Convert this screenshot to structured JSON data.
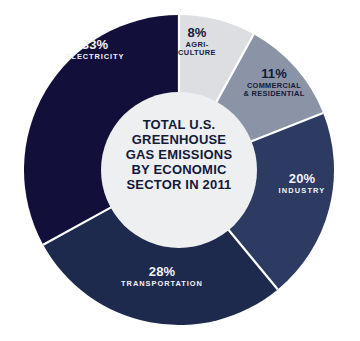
{
  "chart_data": {
    "type": "pie",
    "variant": "donut",
    "title": "TOTAL U.S. GREENHOUSE GAS EMISSIONS BY ECONOMIC SECTOR IN 2011",
    "title_lines": [
      "TOTAL U.S.",
      "GREENHOUSE",
      "GAS EMISSIONS",
      "BY ECONOMIC",
      "SECTOR IN 2011"
    ],
    "unit": "%",
    "legend_position": "none",
    "labels_inside_slices": true,
    "start_angle_deg": 0,
    "direction": "clockwise",
    "categories": [
      "AGRICULTURE",
      "COMMERCIAL & RESIDENTIAL",
      "INDUSTRY",
      "TRANSPORTATION",
      "ELECTRICITY"
    ],
    "values": [
      8,
      11,
      20,
      28,
      33
    ],
    "total": 100,
    "slices": [
      {
        "key": "agriculture",
        "name": "AGRI-\nCULTURE",
        "name_flat": "AGRICULTURE",
        "value": 8,
        "percent_label": "8%",
        "color": "#dcdee2",
        "text_tone": "dark"
      },
      {
        "key": "commercial",
        "name": "COMMERCIAL\n& RESIDENTIAL",
        "name_flat": "COMMERCIAL & RESIDENTIAL",
        "value": 11,
        "percent_label": "11%",
        "color": "#8a94a6",
        "text_tone": "dark"
      },
      {
        "key": "industry",
        "name": "INDUSTRY",
        "name_flat": "INDUSTRY",
        "value": 20,
        "percent_label": "20%",
        "color": "#2d3b63",
        "text_tone": "light"
      },
      {
        "key": "transportation",
        "name": "TRANSPORTATION",
        "name_flat": "TRANSPORTATION",
        "value": 28,
        "percent_label": "28%",
        "color": "#1d2a4d",
        "text_tone": "light"
      },
      {
        "key": "electricity",
        "name": "ELECTRICITY",
        "name_flat": "ELECTRICITY",
        "value": 33,
        "percent_label": "33%",
        "color": "#12103a",
        "text_tone": "light"
      }
    ],
    "geometry": {
      "cx": 179,
      "cy": 170,
      "outer_radius": 155,
      "inner_radius": 78
    },
    "colors": {
      "background": "#ffffff",
      "hole": "#eeeff1",
      "separator": "#ffffff",
      "text_dark": "#131a3a",
      "text_light": "#f2f3f5"
    }
  }
}
